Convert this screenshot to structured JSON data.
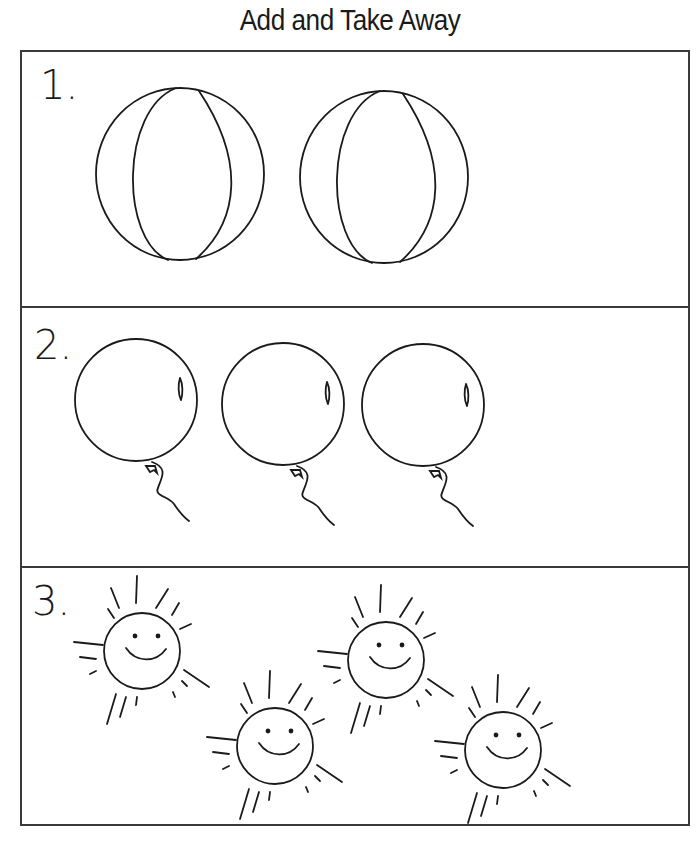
{
  "worksheet": {
    "title": "Add and Take Away",
    "problems": [
      {
        "number": "1.",
        "item": "beach ball",
        "count": 2
      },
      {
        "number": "2.",
        "item": "balloon",
        "count": 3
      },
      {
        "number": "3.",
        "item": "smiling sun",
        "count": 4
      }
    ],
    "colors": {
      "ink": "#1a1a1a",
      "border": "#3a3a3a",
      "background": "#ffffff"
    }
  }
}
